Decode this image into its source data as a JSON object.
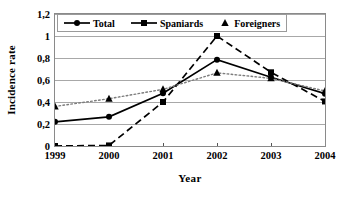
{
  "chart_data": {
    "type": "line",
    "title": "",
    "xlabel": "Year",
    "ylabel": "Incidence rate",
    "categories": [
      "1999",
      "2000",
      "2001",
      "2002",
      "2003",
      "2004"
    ],
    "x": [
      1999,
      2000,
      2001,
      2002,
      2003,
      2004
    ],
    "series": [
      {
        "name": "Total",
        "marker": "circle",
        "linestyle": "solid",
        "color": "#000000",
        "values": [
          0.22,
          0.265,
          0.48,
          0.785,
          0.625,
          0.475
        ]
      },
      {
        "name": "Spaniards",
        "marker": "square",
        "linestyle": "dashed",
        "color": "#000000",
        "values": [
          0.0,
          0.005,
          0.4,
          1.0,
          0.67,
          0.405
        ]
      },
      {
        "name": "Foreigners",
        "marker": "triangle",
        "linestyle": "dotted",
        "color": "#000000",
        "values": [
          0.36,
          0.43,
          0.515,
          0.665,
          0.615,
          0.5
        ]
      }
    ],
    "ylim": [
      0,
      1.2
    ],
    "xlim": [
      1999,
      2004
    ],
    "yticks": [
      0,
      0.2,
      0.4,
      0.6,
      0.8,
      1,
      1.2
    ],
    "ytick_labels": [
      "0",
      "0,2",
      "0,4",
      "0,6",
      "0,8",
      "1",
      "1,2"
    ],
    "grid": "horizontal",
    "legend_position": "top-inside",
    "decimal_separator": ","
  },
  "legend": {
    "entries": [
      {
        "label": "Total",
        "marker": "circle-marker",
        "line": "solid"
      },
      {
        "label": "Spaniards",
        "marker": "square-marker",
        "line": "solid"
      },
      {
        "label": "Foreigners",
        "marker": "triangle-marker",
        "line": "none"
      }
    ]
  },
  "axes": {
    "y_title": "Incidence rate",
    "x_title": "Year"
  },
  "colors": {
    "ink": "#000000",
    "grid": "#a8a8a8",
    "frame": "#8a8a8a",
    "background": "#ffffff"
  }
}
